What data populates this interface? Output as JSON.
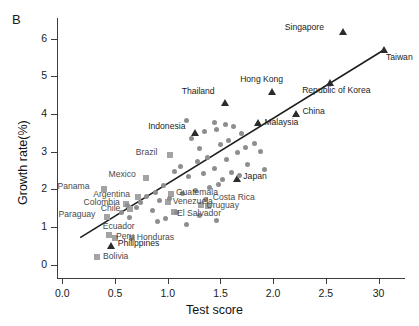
{
  "panel": {
    "label": "B"
  },
  "chart_data": {
    "type": "scatter",
    "title": "",
    "xlabel": "Test score",
    "ylabel": "Growth rate(%)",
    "xlim": [
      -0.05,
      3.25
    ],
    "ylim": [
      -0.35,
      6.55
    ],
    "xticks": [
      "0.0",
      "0.5",
      "1.0",
      "1.5",
      "2.0",
      "2.5",
      "30"
    ],
    "xtick_values": [
      0.0,
      0.5,
      1.0,
      1.5,
      2.0,
      2.5,
      3.0
    ],
    "yticks": [
      "0",
      "1",
      "2",
      "3",
      "4",
      "5",
      "6"
    ],
    "ytick_values": [
      0,
      1,
      2,
      3,
      4,
      5,
      6
    ],
    "grid": false,
    "legend": "none",
    "trendline": {
      "x1": 0.17,
      "y1": 0.72,
      "x2": 3.06,
      "y2": 5.72
    },
    "series": [
      {
        "name": "Labeled East/Southeast Asian economies",
        "marker": "triangle",
        "color": "#2b2b2b",
        "points": [
          {
            "label": "Singapore",
            "x": 2.66,
            "y": 6.18,
            "label_dx": -58,
            "label_dy": -4
          },
          {
            "label": "Taiwan",
            "x": 3.05,
            "y": 5.72,
            "label_dx": 2,
            "label_dy": 9
          },
          {
            "label": "Hong Kong",
            "x": 1.99,
            "y": 4.6,
            "label_dx": -32,
            "label_dy": -11
          },
          {
            "label": "Republic of Korea",
            "x": 2.54,
            "y": 4.84,
            "label_dx": -28,
            "label_dy": 9
          },
          {
            "label": "Thailand",
            "x": 1.54,
            "y": 4.32,
            "label_dx": -43,
            "label_dy": -10
          },
          {
            "label": "China",
            "x": 2.22,
            "y": 4.01,
            "label_dx": 6,
            "label_dy": -2
          },
          {
            "label": "Malaysia",
            "x": 1.86,
            "y": 3.79,
            "label_dx": 6,
            "label_dy": 1
          },
          {
            "label": "Indonesia",
            "x": 1.26,
            "y": 3.52,
            "label_dx": -47,
            "label_dy": -5
          },
          {
            "label": "Japan",
            "x": 1.66,
            "y": 2.29,
            "label_dx": 6,
            "label_dy": -2
          },
          {
            "label": "Philippines",
            "x": 0.46,
            "y": 0.52,
            "label_dx": 7,
            "label_dy": -1
          }
        ]
      },
      {
        "name": "Labeled Latin American countries",
        "marker": "square",
        "color": "#a3a3a3",
        "points": [
          {
            "label": "Brazil",
            "x": 1.02,
            "y": 2.92,
            "label_dx": -34,
            "label_dy": -2
          },
          {
            "label": "Mexico",
            "x": 0.79,
            "y": 2.3,
            "label_dx": -37,
            "label_dy": -3
          },
          {
            "label": "Panama",
            "x": 0.4,
            "y": 2.02,
            "label_dx": -47,
            "label_dy": -2
          },
          {
            "label": "Guatemala",
            "x": 1.03,
            "y": 1.88,
            "label_dx": 5,
            "label_dy": -1
          },
          {
            "label": "Argentina",
            "x": 0.72,
            "y": 1.79,
            "label_dx": -45,
            "label_dy": -2
          },
          {
            "label": "Venezuela",
            "x": 1.0,
            "y": 1.66,
            "label_dx": 5,
            "label_dy": 0
          },
          {
            "label": "Colombia",
            "x": 0.6,
            "y": 1.62,
            "label_dx": -42,
            "label_dy": -1
          },
          {
            "label": "Uruguay",
            "x": 1.32,
            "y": 1.6,
            "label_dx": 5,
            "label_dy": 1
          },
          {
            "label": "Chile",
            "x": 0.64,
            "y": 1.47,
            "label_dx": -29,
            "label_dy": 0
          },
          {
            "label": "El Salvador",
            "x": 1.06,
            "y": 1.4,
            "label_dx": 3,
            "label_dy": 2
          },
          {
            "label": "Paraguay",
            "x": 0.42,
            "y": 1.26,
            "label_dx": -48,
            "label_dy": -2
          },
          {
            "label": "Ecuador",
            "x": 0.44,
            "y": 0.78,
            "label_dx": -6,
            "label_dy": -8
          },
          {
            "label": "Peru",
            "x": 0.5,
            "y": 0.7,
            "label_dx": 1,
            "label_dy": -1
          },
          {
            "label": "Honduras",
            "x": 0.66,
            "y": 0.7,
            "label_dx": 5,
            "label_dy": 0
          },
          {
            "label": "Costa Rica",
            "x": 1.38,
            "y": 1.57,
            "label_dx": 5,
            "label_dy": -8
          },
          {
            "label": "Bolivia",
            "x": 0.33,
            "y": 0.22,
            "label_dx": 6,
            "label_dy": 0
          }
        ]
      },
      {
        "name": "Unlabeled countries",
        "marker": "circle",
        "color": "#8e8e8e",
        "x": [
          1.18,
          1.35,
          1.23,
          1.3,
          1.44,
          1.46,
          1.55,
          1.62,
          1.58,
          1.7,
          1.74,
          1.66,
          1.82,
          1.88,
          1.5,
          1.38,
          1.28,
          1.12,
          1.06,
          1.44,
          1.56,
          1.34,
          1.2,
          1.6,
          1.76,
          1.92,
          1.48,
          1.4,
          1.26,
          1.14,
          0.96,
          0.88,
          1.02,
          0.92,
          0.8,
          0.74,
          0.7,
          0.86,
          1.08,
          1.3,
          0.62,
          0.56,
          0.64,
          1.52,
          1.68,
          1.36,
          1.18,
          1.46,
          0.98,
          0.9
        ],
        "y": [
          3.84,
          3.54,
          3.34,
          3.08,
          3.78,
          3.6,
          3.72,
          3.66,
          3.3,
          3.48,
          3.12,
          2.98,
          3.22,
          3.02,
          3.2,
          2.86,
          2.74,
          2.62,
          2.48,
          2.56,
          2.8,
          2.42,
          2.34,
          2.44,
          2.66,
          2.52,
          2.14,
          2.06,
          1.96,
          1.88,
          2.1,
          1.92,
          1.76,
          1.7,
          1.82,
          1.66,
          1.52,
          1.44,
          1.38,
          1.32,
          1.58,
          1.4,
          1.26,
          2.26,
          2.38,
          1.74,
          1.08,
          1.18,
          1.24,
          1.14
        ]
      }
    ]
  }
}
